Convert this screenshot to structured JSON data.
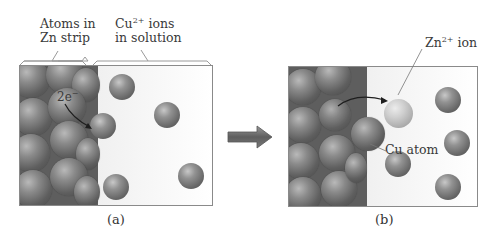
{
  "figure": {
    "panel_a": {
      "caption": "(a)",
      "labels": {
        "zn_atoms": [
          "Atoms in",
          "Zn strip"
        ],
        "cu_ions_base": "Cu",
        "cu_ions_charge": "2+",
        "cu_ions_suffix": " ions",
        "cu_ions_line2": "in solution",
        "electrons_base": "2e",
        "electrons_charge": "−"
      }
    },
    "transition_arrow": "right-arrow",
    "panel_b": {
      "caption": "(b)",
      "labels": {
        "zn_ion_base": "Zn",
        "zn_ion_charge": "2+",
        "zn_ion_suffix": " ion",
        "cu_atom": "Cu atom"
      }
    },
    "colors": {
      "atom_gray": "#6a6a6a",
      "solution_bg": "#f0f0f0",
      "border": "#8a8a8a",
      "arrow_fill": "#6b6b6b"
    }
  }
}
